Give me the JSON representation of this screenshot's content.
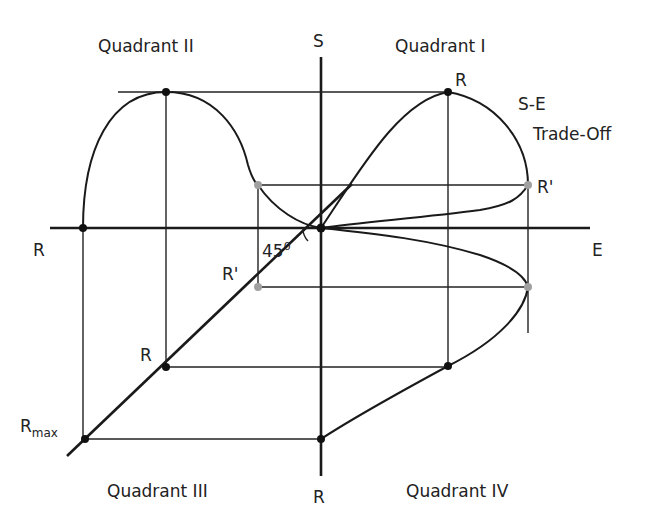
{
  "figure": {
    "axes": {
      "vertical_top": "S",
      "vertical_bottom": "R",
      "horizontal_right": "E",
      "horizontal_left": "R"
    },
    "quadrants": {
      "q1": "Quadrant I",
      "q2": "Quadrant II",
      "q3": "Quadrant III",
      "q4": "Quadrant IV"
    },
    "labels": {
      "q1_peak": "R",
      "q1_r_prime": "R'",
      "trade_off_line1": "S-E",
      "trade_off_line2": "Trade-Off",
      "q3_r": "R",
      "q3_r_prime": "R'",
      "q3_rmax_main": "R",
      "q3_rmax_sub": "max",
      "angle_value": "45",
      "angle_unit": "0"
    },
    "colors": {
      "line": "#1a1a1a",
      "highlight_point": "#a0a0a0",
      "key_point": "#111111"
    }
  }
}
